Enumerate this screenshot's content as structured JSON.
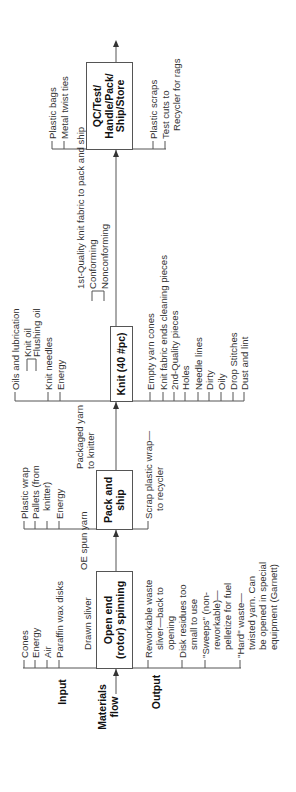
{
  "legend": {
    "input": "Input",
    "materials_flow": "Materials\nflow",
    "output": "Output"
  },
  "processes": [
    {
      "name": "Open end\n(rotor) spinning",
      "feed_label": "Drawn sliver",
      "inputs": [
        "Cones",
        "Energy",
        "Air",
        "Paraffin wax disks"
      ],
      "outputs": [
        "Reworkable waste\n   sliver—back to\n   opening",
        "Disk residues too\n   small to use",
        "\"Sweeps\" (non-\n   reworkable)—\n   pelletize for fuel",
        "\"Hard\" waste—\n   twisted yarn. Can\n   be opened in special\n   equipment (Garnett)"
      ]
    },
    {
      "name": "Pack and\nship",
      "feed_label": "OE spun yarn",
      "inputs": [
        "Plastic wrap",
        "Pallets (from\n   knitter)",
        "Energy"
      ],
      "outputs": [
        "Scrap plastic wrap—\n   to recycler"
      ]
    },
    {
      "name": "Knit (40 #pc)",
      "feed_label": "Packaged yarn\nto knitter",
      "inputs": [
        "Oils and lubrication",
        "Knit oil",
        "Flushing oil",
        "Knit needles",
        "Energy"
      ],
      "outputs": [
        "Empty yarn cones",
        "Knit fabric ends cleaning pieces",
        "2nd-Quality pieces",
        "Holes",
        "Needle lines",
        "Dirty",
        "Oily",
        "Drop Stitches",
        "Dust and lint"
      ]
    },
    {
      "name": "QC/Test/\nHandle/Pack/\nShip/Store",
      "feed_label": "1st-Quality knit fabric to pack and ship",
      "feed_sub": [
        "Conforming",
        "Nonconforming"
      ],
      "inputs": [
        "Plastic bags",
        "Metal twist ties"
      ],
      "outputs": [
        "Plastic scraps",
        "Test cuts to\n   Recycler for rags"
      ]
    }
  ],
  "colors": {
    "line": "#555555",
    "text": "#333333",
    "box_border": "#555555"
  }
}
